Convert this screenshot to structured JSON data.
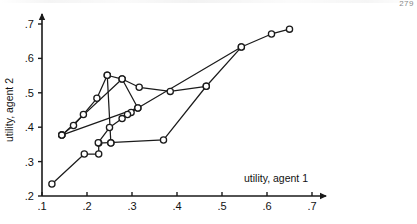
{
  "figure": {
    "page_marker": "279"
  },
  "chart_data": {
    "type": "line",
    "title": "",
    "xlabel": "utility, agent 1",
    "ylabel": "utility, agent 2",
    "xlim": [
      0.1,
      0.7
    ],
    "ylim": [
      0.2,
      0.7
    ],
    "xticks": [
      0.1,
      0.2,
      0.3,
      0.4,
      0.5,
      0.6,
      0.7
    ],
    "xticklabels": [
      ".1",
      ".2",
      ".3",
      ".4",
      ".5",
      ".6",
      ".7"
    ],
    "yticks": [
      0.2,
      0.3,
      0.4,
      0.5,
      0.6,
      0.7
    ],
    "yticklabels": [
      ".2",
      ".3",
      ".4",
      ".5",
      ".6",
      ".7"
    ],
    "grid": false,
    "legend": null,
    "marker": "open-circle",
    "series": [
      {
        "name": "path-lower-ascending",
        "marker_style": "open-circle",
        "points": [
          [
            0.122,
            0.235
          ],
          [
            0.194,
            0.322
          ],
          [
            0.226,
            0.322
          ],
          [
            0.226,
            0.354
          ],
          [
            0.37,
            0.363
          ],
          [
            0.465,
            0.519
          ],
          [
            0.543,
            0.633
          ],
          [
            0.61,
            0.671
          ],
          [
            0.65,
            0.685
          ]
        ]
      },
      {
        "name": "path-upper-left-ascending",
        "marker_style": "open-circle",
        "points": [
          [
            0.144,
            0.377
          ],
          [
            0.17,
            0.405
          ],
          [
            0.192,
            0.437
          ],
          [
            0.222,
            0.484
          ],
          [
            0.245,
            0.551
          ],
          [
            0.253,
            0.355
          ],
          [
            0.253,
            0.354
          ]
        ]
      },
      {
        "name": "path-peak-descending",
        "marker_style": "open-circle",
        "points": [
          [
            0.245,
            0.551
          ],
          [
            0.278,
            0.54
          ],
          [
            0.316,
            0.516
          ],
          [
            0.385,
            0.504
          ],
          [
            0.465,
            0.519
          ]
        ]
      },
      {
        "name": "path-crossing-diagonal",
        "marker_style": "open-circle",
        "points": [
          [
            0.144,
            0.377
          ],
          [
            0.278,
            0.54
          ],
          [
            0.313,
            0.456
          ],
          [
            0.298,
            0.443
          ],
          [
            0.29,
            0.437
          ],
          [
            0.278,
            0.425
          ],
          [
            0.25,
            0.399
          ],
          [
            0.225,
            0.355
          ]
        ]
      },
      {
        "name": "path-long-chord",
        "marker_style": "open-circle",
        "points": [
          [
            0.144,
            0.377
          ],
          [
            0.313,
            0.456
          ],
          [
            0.543,
            0.633
          ]
        ]
      }
    ]
  }
}
